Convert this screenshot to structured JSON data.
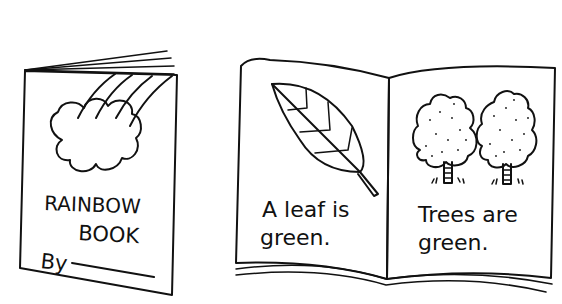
{
  "illustration": {
    "closed_book": {
      "title_line1": "RAINBOW",
      "title_line2": "BOOK",
      "author_prefix": "By",
      "decorations": [
        "rainbow",
        "cloud"
      ]
    },
    "open_book": {
      "left_page": {
        "text_line1": "A leaf is",
        "text_line2": "green.",
        "picture": "leaf-icon"
      },
      "right_page": {
        "text_line1": "Trees are",
        "text_line2": "green.",
        "picture": "trees-icon"
      }
    }
  },
  "colors": {
    "ink": "#111111",
    "paper": "#ffffff"
  }
}
